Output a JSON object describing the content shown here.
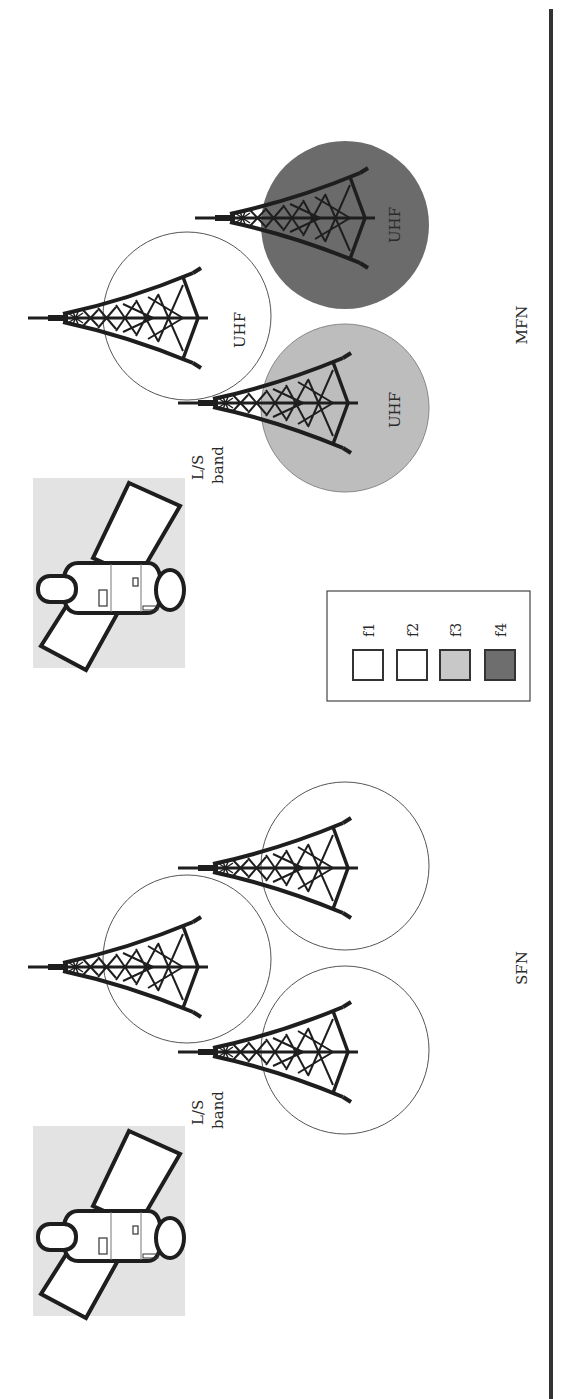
{
  "figure": {
    "divider_color": "#333333"
  },
  "sections": {
    "mfn": {
      "label": "MFN",
      "satellite_link_label_line1": "L/S",
      "satellite_link_label_line2": "band",
      "cells": [
        {
          "id": "center",
          "label": "UHF",
          "fill": "#ffffff",
          "frequency": "f1"
        },
        {
          "id": "top-right",
          "label": "UHF",
          "fill": "#6b6b6b",
          "frequency": "f4"
        },
        {
          "id": "bottom-right",
          "label": "UHF",
          "fill": "#bdbdbd",
          "frequency": "f3"
        }
      ]
    },
    "sfn": {
      "label": "SFN",
      "satellite_link_label_line1": "L/S",
      "satellite_link_label_line2": "band",
      "cells": [
        {
          "id": "center",
          "label": "",
          "fill": "#ffffff"
        },
        {
          "id": "top-right",
          "label": "",
          "fill": "#ffffff"
        },
        {
          "id": "bottom-right",
          "label": "",
          "fill": "#ffffff"
        }
      ]
    }
  },
  "legend": {
    "items": [
      {
        "label": "f1",
        "color": "#ffffff"
      },
      {
        "label": "f2",
        "color": "#ffffff"
      },
      {
        "label": "f3",
        "color": "#c8c8c8"
      },
      {
        "label": "f4",
        "color": "#6e6e6e"
      }
    ]
  },
  "colors": {
    "satellite_bg": "#e3e3e3",
    "tower": "#1e1e1e",
    "circle_outline": "#555555"
  }
}
